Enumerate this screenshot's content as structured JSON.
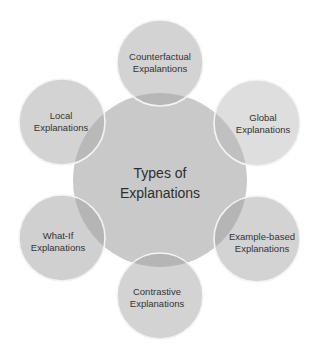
{
  "diagram": {
    "type": "radial-venn",
    "center": {
      "label_line1": "Types of",
      "label_line2": "Explanations",
      "cx": 160,
      "cy": 180,
      "r": 87,
      "fill": "#c9c9c9"
    },
    "nodes": [
      {
        "id": "counterfactual",
        "label_line1": "Counterfactual",
        "label_line2": "Expalantions",
        "cx": 160,
        "cy": 63,
        "r": 43,
        "fill": "#d3d3d3"
      },
      {
        "id": "local",
        "label_line1": "Local",
        "label_line2": "Explanations",
        "cx": 62,
        "cy": 122,
        "r": 43,
        "fill": "#d3d3d3"
      },
      {
        "id": "global",
        "label_line1": "Global",
        "label_line2": "Explanations",
        "cx": 257,
        "cy": 123,
        "r": 43,
        "fill": "#dedede"
      },
      {
        "id": "what-if",
        "label_line1": "What-If",
        "label_line2": "Explanations",
        "cx": 62,
        "cy": 238,
        "r": 43,
        "fill": "#d0d0d0"
      },
      {
        "id": "example-based",
        "label_line1": "Example-based",
        "label_line2": "Explanations",
        "cx": 257,
        "cy": 239,
        "r": 43,
        "fill": "#d3d3d3"
      },
      {
        "id": "contrastive",
        "label_line1": "Contrastive",
        "label_line2": "Explanations",
        "cx": 160,
        "cy": 296,
        "r": 43,
        "fill": "#d3d3d3"
      }
    ],
    "colors": {
      "overlap": "#b5b5b5",
      "stroke": "#f4f4f4",
      "text": "#333333",
      "background": "#ffffff"
    }
  }
}
